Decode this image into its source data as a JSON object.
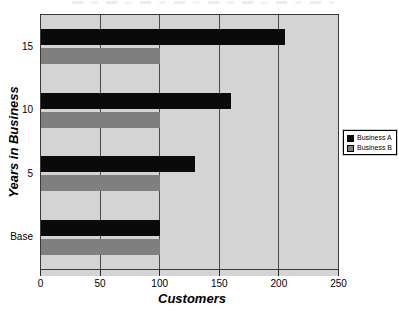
{
  "chart_data": {
    "type": "bar",
    "orientation": "horizontal",
    "categories": [
      "15",
      "10",
      "5",
      "Base"
    ],
    "series": [
      {
        "name": "Business A",
        "color": "#0a0a0a",
        "values": [
          205,
          160,
          130,
          100
        ]
      },
      {
        "name": "Business B",
        "color": "#7f7f7f",
        "values": [
          100,
          100,
          100,
          100
        ]
      }
    ],
    "xlabel": "Customers",
    "ylabel": "Years in Business",
    "xlim": [
      0,
      250
    ],
    "xticks": [
      0,
      50,
      100,
      150,
      200,
      250
    ],
    "grid": "vertical",
    "legend_position": "right-outside",
    "plot_background": "#d4d4d4",
    "gridline_color": "#4a4a4a",
    "note_title": "title cropped out of frame at top edge"
  }
}
